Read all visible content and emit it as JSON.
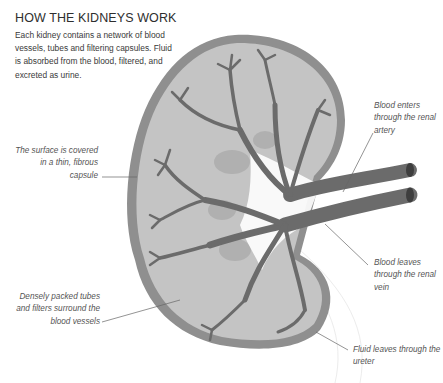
{
  "header": {
    "title": "HOW THE KIDNEYS WORK",
    "intro": "Each kidney contains a network of blood vessels, tubes and filtering capsules. Fluid is absorbed from the blood, filtered, and excreted as urine."
  },
  "labels": {
    "surface": "The surface is covered in a thin, fibrous capsule",
    "dense": "Densely packed tubes and filters surround the blood vessels",
    "artery": "Blood enters through the renal artery",
    "vein": "Blood leaves through the renal vein",
    "ureter": "Fluid leaves through the ureter"
  },
  "colors": {
    "capsule": "#8f8f8f",
    "tissue": "#c4c4c4",
    "lobe": "#b0b0b0",
    "vessel": "#6b6b6b",
    "vessel_end": "#3e3e3e",
    "leader": "#666666",
    "background": "#ffffff"
  }
}
